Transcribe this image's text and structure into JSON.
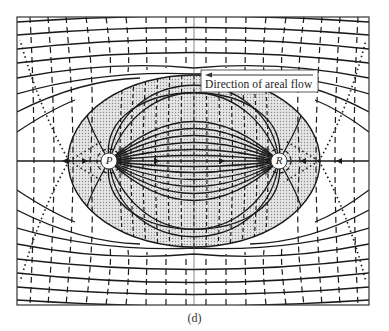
{
  "figure": {
    "type": "flow-net diagram (streamlines and equipotentials between two wells)",
    "panel_label": "(d)",
    "annotation": {
      "text": "Direction of areal flow",
      "arrow_direction": "left"
    },
    "wells": [
      {
        "id": "P",
        "label": "P",
        "role": "producer (sink)"
      },
      {
        "id": "R",
        "label": "R",
        "role": "injector (source)"
      }
    ],
    "shaded_region": "elliptical zone of streamlines connecting R to P",
    "line_styles": {
      "streamlines": "solid with cross ticks",
      "equipotentials": "dashed",
      "stagnation_separatrix": "dotted"
    },
    "colors": {
      "line": "#1a1a1a",
      "shading": "#cfcfcf",
      "background": "#ffffff",
      "frame": "#333333"
    }
  }
}
